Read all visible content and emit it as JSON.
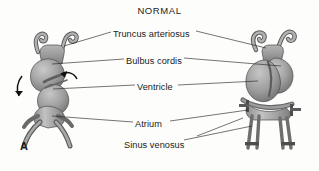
{
  "figure": {
    "title": "NORMAL",
    "panel_letter": "A",
    "background_color": "#fdfdfc",
    "ink_color": "#1b1b1b",
    "tissue_fill_light": "#b9b9b9",
    "tissue_fill_mid": "#9a9a9a",
    "tissue_fill_dark": "#7a7a7a",
    "tissue_outline": "#4a4a4a"
  },
  "labels": [
    {
      "id": "truncus-arteriosus",
      "text": "Truncus arteriosus",
      "x": 113,
      "y": 29
    },
    {
      "id": "bulbus-cordis",
      "text": "Bulbus cordis",
      "x": 126,
      "y": 56
    },
    {
      "id": "ventricle",
      "text": "Ventricle",
      "x": 137,
      "y": 82
    },
    {
      "id": "atrium",
      "text": "Atrium",
      "x": 135,
      "y": 119
    },
    {
      "id": "sinus-venosus",
      "text": "Sinus venosus",
      "x": 124,
      "y": 140
    }
  ],
  "structures": {
    "left_figure": {
      "name": "early-looping-heart-tube",
      "stage": "S-shaped heart tube, panel A left",
      "rotation_arrows": 2
    },
    "right_figure": {
      "name": "later-looping-heart-tube",
      "stage": "folded heart with paired vessels, panel A right"
    }
  }
}
